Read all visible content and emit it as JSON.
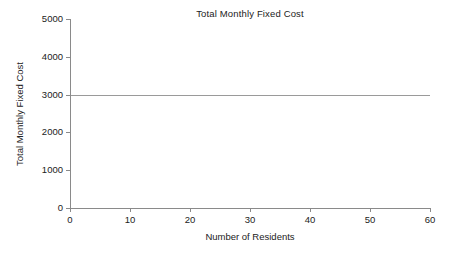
{
  "chart_data": {
    "type": "line",
    "title": "Total Monthly Fixed Cost",
    "xlabel": "Number of Residents",
    "ylabel": "Total Monthly Fixed Cost",
    "xlim": [
      0,
      60
    ],
    "ylim": [
      0,
      5000
    ],
    "grid": false,
    "legend": null,
    "x_ticks": [
      0,
      10,
      20,
      30,
      40,
      50,
      60
    ],
    "x_tick_labels": [
      "0",
      "10",
      "20",
      "30",
      "40",
      "50",
      "60"
    ],
    "y_ticks": [
      0,
      1000,
      2000,
      3000,
      4000,
      5000
    ],
    "y_tick_labels": [
      "0",
      "1000",
      "2000",
      "3000",
      "4000",
      "5000"
    ],
    "series": [
      {
        "name": "Total Monthly Fixed Cost",
        "color": "#9a9a9a",
        "x": [
          0,
          60
        ],
        "values": [
          3000,
          3000
        ]
      }
    ],
    "annotations": []
  },
  "figure": {
    "background_color": "#ffffff",
    "axis_color": "#8a8a8a",
    "text_color": "#222222"
  }
}
